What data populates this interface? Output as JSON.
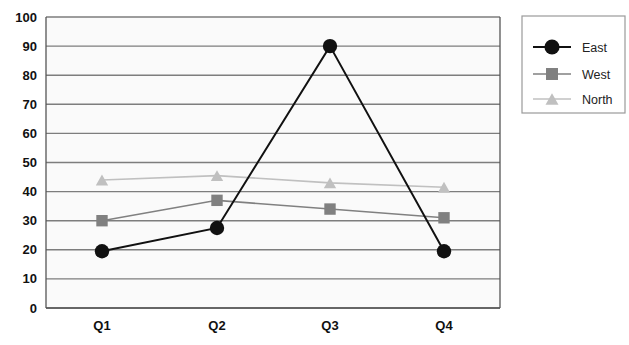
{
  "chart_data": {
    "type": "line",
    "title": "",
    "subtitle": "",
    "xlabel": "",
    "ylabel": "",
    "categories": [
      "Q1",
      "Q2",
      "Q3",
      "Q4"
    ],
    "series": [
      {
        "name": "East",
        "values": [
          19.5,
          27.5,
          90,
          19.5
        ],
        "color": "#111111",
        "marker": "circle",
        "line_color": "#111111"
      },
      {
        "name": "West",
        "values": [
          30,
          37,
          34,
          31
        ],
        "color": "#808080",
        "marker": "square",
        "line_color": "#808080"
      },
      {
        "name": "North",
        "values": [
          44,
          45.5,
          43,
          41.5
        ],
        "color": "#c0c0c0",
        "marker": "triangle",
        "line_color": "#c0c0c0"
      }
    ],
    "ylim": [
      0,
      100
    ],
    "ytick_values": [
      0,
      10,
      20,
      30,
      40,
      50,
      60,
      70,
      80,
      90,
      100
    ],
    "ytick_labels": [
      "0",
      "10",
      "20",
      "30",
      "40",
      "50",
      "60",
      "70",
      "80",
      "90",
      "100"
    ],
    "grid": true,
    "grid_axis": "y",
    "grid_color": "#7d7d7d",
    "legend_position": "right",
    "plot_background": "#fafafa",
    "figure_background": "#ffffff",
    "legend_entries": [
      "East",
      "West",
      "North"
    ]
  },
  "legend": {
    "items": [
      {
        "label": "East",
        "marker": "circle-marker",
        "color": "#111111"
      },
      {
        "label": "West",
        "marker": "square-marker",
        "color": "#808080"
      },
      {
        "label": "North",
        "marker": "triangle-marker",
        "color": "#c0c0c0"
      }
    ]
  }
}
